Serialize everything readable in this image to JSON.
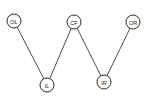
{
  "diagram": {
    "type": "graph",
    "nodes": [
      {
        "id": "OL",
        "label": "OL",
        "x": 14,
        "y": 21
      },
      {
        "id": "CF",
        "label": "CF",
        "x": 74,
        "y": 22
      },
      {
        "id": "OR",
        "label": "OR",
        "x": 133,
        "y": 22
      },
      {
        "id": "IL",
        "label": "IL",
        "x": 47,
        "y": 85
      },
      {
        "id": "IR",
        "label": "IR",
        "x": 104,
        "y": 82
      }
    ],
    "edges": [
      {
        "from": "OL",
        "to": "IL"
      },
      {
        "from": "IL",
        "to": "CF"
      },
      {
        "from": "CF",
        "to": "IR"
      },
      {
        "from": "IR",
        "to": "OR"
      }
    ],
    "node_radius": 7,
    "colors": {
      "stroke": "#2a2a2a",
      "background": "#ffffff"
    }
  }
}
